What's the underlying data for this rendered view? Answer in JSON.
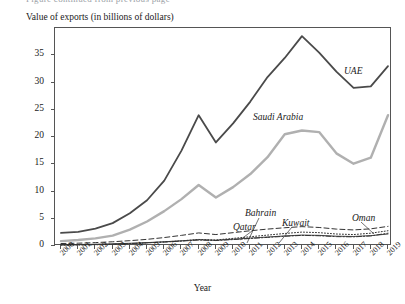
{
  "figure": {
    "cut_caption": "Figure continued from previous page",
    "ylabel": "Value of exports (in billions of dollars)",
    "xlabel": "Year"
  },
  "axis": {
    "y_ticks": [
      "0",
      "5",
      "10",
      "15",
      "20",
      "25",
      "30",
      "35"
    ],
    "x_ticks": [
      "2000",
      "2001",
      "2002",
      "2003",
      "2004",
      "2005",
      "2006",
      "2007",
      "2008",
      "2009",
      "2010",
      "2011",
      "2012",
      "2013",
      "2014",
      "2015",
      "2016",
      "2017",
      "2018",
      "2019"
    ]
  },
  "annotations": {
    "uae": "UAE",
    "saudi": "Saudi Arabia",
    "bahrain": "Bahrain",
    "qatar": "Qatar",
    "kuwait": "Kuwait",
    "oman": "Oman"
  },
  "colors": {
    "uae": "#4a4a4a",
    "saudi": "#b0b0b0",
    "bahrain": "#333333",
    "qatar": "#333333",
    "kuwait": "#333333",
    "oman": "#333333",
    "axis": "#555555",
    "background": "#ffffff"
  },
  "chart_data": {
    "type": "line",
    "title": "",
    "xlabel": "Year",
    "ylabel": "Value of exports (in billions of dollars)",
    "x": [
      2000,
      2001,
      2002,
      2003,
      2004,
      2005,
      2006,
      2007,
      2008,
      2009,
      2010,
      2011,
      2012,
      2013,
      2014,
      2015,
      2016,
      2017,
      2018,
      2019
    ],
    "xlim": [
      2000,
      2019
    ],
    "ylim": [
      0,
      40
    ],
    "y_ticks": [
      0,
      5,
      10,
      15,
      20,
      25,
      30,
      35
    ],
    "grid": false,
    "legend": "inline-annotations",
    "series": [
      {
        "name": "UAE",
        "style": "solid",
        "color": "#4a4a4a",
        "width": 1.8,
        "values": [
          2.4,
          2.6,
          3.2,
          4.2,
          6.0,
          8.4,
          12.0,
          17.5,
          24.0,
          19.0,
          22.5,
          26.5,
          31.0,
          34.5,
          38.5,
          35.5,
          32.0,
          29.0,
          29.3,
          33.0
        ]
      },
      {
        "name": "Saudi Arabia",
        "style": "solid",
        "color": "#b0b0b0",
        "width": 2.4,
        "values": [
          0.9,
          1.1,
          1.4,
          1.9,
          3.0,
          4.5,
          6.4,
          8.6,
          11.2,
          8.9,
          10.8,
          13.2,
          16.3,
          20.5,
          21.2,
          20.9,
          17.0,
          15.1,
          16.2,
          24.0
        ]
      },
      {
        "name": "Bahrain",
        "style": "solid-thin",
        "color": "#333333",
        "width": 0.9,
        "values": [
          0.25,
          0.28,
          0.32,
          0.4,
          0.5,
          0.62,
          0.78,
          0.95,
          1.15,
          1.05,
          1.25,
          1.45,
          1.65,
          1.85,
          2.0,
          1.95,
          1.8,
          1.75,
          1.9,
          2.2
        ]
      },
      {
        "name": "Qatar",
        "style": "dotted",
        "color": "#333333",
        "width": 1.0,
        "values": [
          0.15,
          0.18,
          0.22,
          0.3,
          0.42,
          0.58,
          0.75,
          0.95,
          1.2,
          1.1,
          1.4,
          1.7,
          2.0,
          2.3,
          2.55,
          2.45,
          2.2,
          2.1,
          2.35,
          2.8
        ]
      },
      {
        "name": "Kuwait",
        "style": "dashed",
        "color": "#333333",
        "width": 1.0,
        "values": [
          0.45,
          0.52,
          0.62,
          0.78,
          0.98,
          1.22,
          1.55,
          1.95,
          2.4,
          2.1,
          2.45,
          2.8,
          3.1,
          3.35,
          3.55,
          3.4,
          3.1,
          2.95,
          3.15,
          3.6
        ]
      },
      {
        "name": "Oman",
        "style": "dash-dot",
        "color": "#333333",
        "width": 1.0,
        "values": [
          0.2,
          0.23,
          0.28,
          0.35,
          0.45,
          0.58,
          0.72,
          0.9,
          1.1,
          1.0,
          1.18,
          1.38,
          1.58,
          1.78,
          1.95,
          1.88,
          1.72,
          1.68,
          1.85,
          2.35
        ]
      }
    ]
  }
}
